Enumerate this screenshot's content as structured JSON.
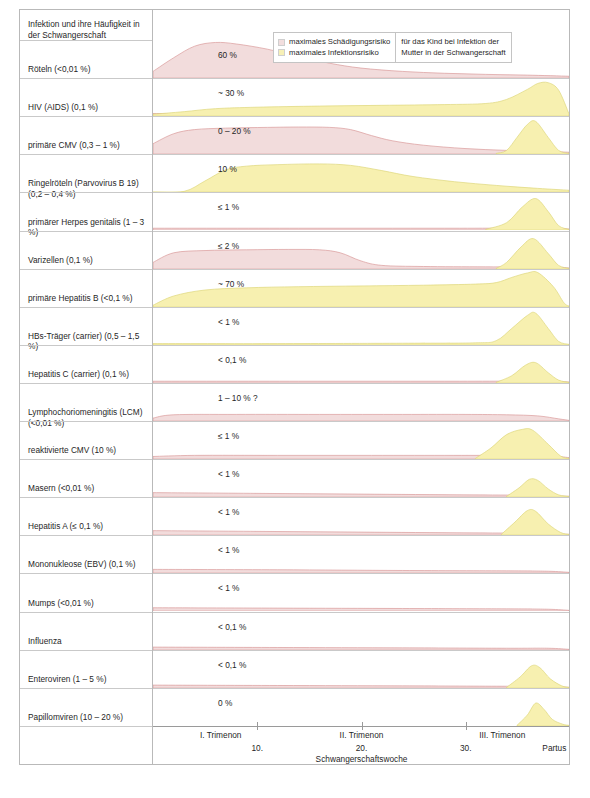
{
  "header": {
    "title": "Infektion und ihre Häufigkeit in der Schwangerschaft"
  },
  "legend": {
    "items": [
      {
        "label": "maximales Schädigungsrisiko",
        "color": "#f2dede"
      },
      {
        "label": "maximales Infektionsrisiko",
        "color": "#f7f0b6"
      }
    ],
    "note_line1": "für das Kind bei Infektion der",
    "note_line2": "Mutter in der Schwangerschaft"
  },
  "axis": {
    "trimester": [
      "I. Trimenon",
      "II. Trimenon",
      "III. Trimenon"
    ],
    "weeks": [
      "10.",
      "20.",
      "30."
    ],
    "partus": "Partus",
    "xlabel": "Schwangerschaftswoche"
  },
  "colors": {
    "damage_fill": "#f2dcdc",
    "damage_stroke": "#d99a9a",
    "infection_fill": "#f7f0b0",
    "infection_stroke": "#ded77a",
    "separator": "#c9c9c9",
    "border": "#b9b9b9"
  },
  "chart_data": {
    "type": "area",
    "title": "Infektion und ihre Häufigkeit in der Schwangerschaft",
    "xlabel": "Schwangerschaftswoche",
    "ylabel": "Risiko",
    "x_ticks": [
      10,
      20,
      30
    ],
    "x_tick_labels": [
      "10.",
      "20.",
      "30."
    ],
    "x_range": [
      0,
      40
    ],
    "grid": false,
    "legend_position": "top-right",
    "series_names": [
      "maximales Schädigungsrisiko",
      "maximales Infektionsrisiko"
    ],
    "rows": [
      {
        "infection": "Röteln (<0,01 %)",
        "value": "60 %",
        "damage": [
          [
            0,
            0.18
          ],
          [
            2,
            0.55
          ],
          [
            4,
            0.86
          ],
          [
            6,
            0.96
          ],
          [
            8,
            0.92
          ],
          [
            11,
            0.78
          ],
          [
            14,
            0.58
          ],
          [
            17,
            0.4
          ],
          [
            20,
            0.27
          ],
          [
            24,
            0.18
          ],
          [
            28,
            0.13
          ],
          [
            32,
            0.1
          ],
          [
            36,
            0.08
          ],
          [
            40,
            0.05
          ]
        ],
        "infection_curve": []
      },
      {
        "infection": "HIV (AIDS) (0,1 %)",
        "value": "~ 30 %",
        "damage": [
          [
            0,
            0.07
          ],
          [
            10,
            0.06
          ],
          [
            20,
            0.05
          ],
          [
            30,
            0.05
          ],
          [
            36,
            0.05
          ],
          [
            39,
            0.05
          ],
          [
            40,
            0.02
          ]
        ],
        "infection_curve": [
          [
            0,
            0.05
          ],
          [
            3,
            0.12
          ],
          [
            6,
            0.2
          ],
          [
            10,
            0.24
          ],
          [
            16,
            0.27
          ],
          [
            22,
            0.29
          ],
          [
            28,
            0.31
          ],
          [
            32,
            0.34
          ],
          [
            34,
            0.45
          ],
          [
            36,
            0.72
          ],
          [
            37,
            0.88
          ],
          [
            38,
            0.9
          ],
          [
            39,
            0.7
          ],
          [
            40,
            0.06
          ]
        ]
      },
      {
        "infection": "primäre CMV (0,3 – 1 %)",
        "value": "0 – 20 %",
        "damage": [
          [
            0,
            0.28
          ],
          [
            2,
            0.55
          ],
          [
            4,
            0.66
          ],
          [
            7,
            0.7
          ],
          [
            11,
            0.72
          ],
          [
            14,
            0.73
          ],
          [
            17,
            0.72
          ],
          [
            19,
            0.66
          ],
          [
            21,
            0.5
          ],
          [
            23,
            0.36
          ],
          [
            26,
            0.24
          ],
          [
            30,
            0.15
          ],
          [
            34,
            0.1
          ],
          [
            38,
            0.07
          ],
          [
            40,
            0.05
          ]
        ],
        "infection_curve": [
          [
            33,
            0.02
          ],
          [
            34,
            0.1
          ],
          [
            35,
            0.45
          ],
          [
            36,
            0.8
          ],
          [
            36.8,
            0.88
          ],
          [
            38,
            0.45
          ],
          [
            39,
            0.1
          ],
          [
            40,
            0.02
          ]
        ]
      },
      {
        "infection": "Ringelröteln (Parvovirus B 19) (0,2 – 0,4 %)",
        "value": "10 %",
        "damage": [],
        "infection_curve": [
          [
            0,
            0.0
          ],
          [
            3,
            0.02
          ],
          [
            5,
            0.3
          ],
          [
            7,
            0.6
          ],
          [
            9,
            0.7
          ],
          [
            12,
            0.74
          ],
          [
            16,
            0.76
          ],
          [
            19,
            0.72
          ],
          [
            22,
            0.58
          ],
          [
            25,
            0.42
          ],
          [
            29,
            0.28
          ],
          [
            33,
            0.18
          ],
          [
            37,
            0.1
          ],
          [
            40,
            0.05
          ]
        ]
      },
      {
        "infection": "primärer Herpes genitalis (1 – 3 %)",
        "value": "≤ 1 %",
        "damage": [
          [
            0,
            0.05
          ],
          [
            14,
            0.05
          ],
          [
            28,
            0.05
          ],
          [
            38,
            0.05
          ],
          [
            40,
            0.03
          ]
        ],
        "infection_curve": [
          [
            32,
            0.02
          ],
          [
            34,
            0.2
          ],
          [
            35.5,
            0.62
          ],
          [
            36.8,
            0.85
          ],
          [
            38,
            0.5
          ],
          [
            39,
            0.12
          ],
          [
            40,
            0.02
          ]
        ]
      },
      {
        "infection": "Varizellen (0,1 %)",
        "value": "≤ 2 %",
        "damage": [
          [
            0,
            0.18
          ],
          [
            2,
            0.44
          ],
          [
            5,
            0.5
          ],
          [
            9,
            0.52
          ],
          [
            13,
            0.53
          ],
          [
            16,
            0.52
          ],
          [
            18,
            0.44
          ],
          [
            20,
            0.22
          ],
          [
            22,
            0.1
          ],
          [
            26,
            0.07
          ],
          [
            32,
            0.06
          ],
          [
            38,
            0.06
          ],
          [
            40,
            0.03
          ]
        ],
        "infection_curve": [
          [
            33,
            0.02
          ],
          [
            34,
            0.18
          ],
          [
            35.4,
            0.6
          ],
          [
            36.6,
            0.82
          ],
          [
            38,
            0.42
          ],
          [
            39,
            0.1
          ],
          [
            40,
            0.02
          ]
        ]
      },
      {
        "infection": "primäre Hepatitis B (<0,1 %)",
        "value": "~ 70 %",
        "damage": [],
        "infection_curve": [
          [
            0,
            0.05
          ],
          [
            2,
            0.3
          ],
          [
            5,
            0.46
          ],
          [
            9,
            0.52
          ],
          [
            14,
            0.55
          ],
          [
            20,
            0.57
          ],
          [
            26,
            0.59
          ],
          [
            31,
            0.62
          ],
          [
            33,
            0.66
          ],
          [
            34.5,
            0.8
          ],
          [
            36,
            0.92
          ],
          [
            37,
            0.93
          ],
          [
            38.5,
            0.55
          ],
          [
            39.5,
            0.12
          ],
          [
            40,
            0.03
          ]
        ]
      },
      {
        "infection": "HBs-Träger (carrier) (0,5 – 1,5 %)",
        "value": "< 1 %",
        "damage": [],
        "infection_curve": [
          [
            0,
            0.04
          ],
          [
            12,
            0.04
          ],
          [
            24,
            0.05
          ],
          [
            31,
            0.06
          ],
          [
            33,
            0.12
          ],
          [
            34.5,
            0.45
          ],
          [
            36,
            0.8
          ],
          [
            36.8,
            0.86
          ],
          [
            38,
            0.45
          ],
          [
            39,
            0.1
          ],
          [
            40,
            0.02
          ]
        ]
      },
      {
        "infection": "Hepatitis C (carrier) (0,1 %)",
        "value": "< 0,1 %",
        "damage": [
          [
            0,
            0.05
          ],
          [
            14,
            0.05
          ],
          [
            28,
            0.05
          ],
          [
            38,
            0.05
          ],
          [
            40,
            0.03
          ]
        ],
        "infection_curve": [
          [
            33,
            0.02
          ],
          [
            34.5,
            0.2
          ],
          [
            35.8,
            0.48
          ],
          [
            36.8,
            0.55
          ],
          [
            38,
            0.28
          ],
          [
            39,
            0.08
          ],
          [
            40,
            0.02
          ]
        ]
      },
      {
        "infection": "Lymphochoriomeningitis (LCM) (<0,01 %)",
        "value": "1 – 10 % ?",
        "damage": [
          [
            0,
            0.08
          ],
          [
            2,
            0.17
          ],
          [
            8,
            0.18
          ],
          [
            16,
            0.18
          ],
          [
            24,
            0.18
          ],
          [
            30,
            0.18
          ],
          [
            34,
            0.17
          ],
          [
            37,
            0.14
          ],
          [
            39,
            0.06
          ],
          [
            40,
            0.02
          ]
        ],
        "infection_curve": []
      },
      {
        "infection": "reaktivierte CMV (10 %)",
        "value": "≤ 1 %",
        "damage": [
          [
            0,
            0.07
          ],
          [
            4,
            0.1
          ],
          [
            12,
            0.1
          ],
          [
            20,
            0.1
          ],
          [
            28,
            0.1
          ],
          [
            34,
            0.1
          ],
          [
            38,
            0.09
          ],
          [
            40,
            0.04
          ]
        ],
        "infection_curve": [
          [
            31,
            0.02
          ],
          [
            32.5,
            0.3
          ],
          [
            34,
            0.66
          ],
          [
            35.5,
            0.8
          ],
          [
            36.5,
            0.78
          ],
          [
            38,
            0.4
          ],
          [
            39.2,
            0.08
          ],
          [
            40,
            0.02
          ]
        ]
      },
      {
        "infection": "Masern (<0,01 %)",
        "value": "< 1 %",
        "damage": [
          [
            0,
            0.12
          ],
          [
            10,
            0.1
          ],
          [
            20,
            0.08
          ],
          [
            30,
            0.06
          ],
          [
            36,
            0.05
          ],
          [
            40,
            0.02
          ]
        ],
        "infection_curve": [
          [
            34,
            0.02
          ],
          [
            35.2,
            0.25
          ],
          [
            36.2,
            0.48
          ],
          [
            37,
            0.45
          ],
          [
            38,
            0.22
          ],
          [
            39,
            0.06
          ],
          [
            40,
            0.02
          ]
        ]
      },
      {
        "infection": "Hepatitis A (≤ 0,1 %)",
        "value": "< 1 %",
        "damage": [
          [
            0,
            0.12
          ],
          [
            10,
            0.1
          ],
          [
            20,
            0.08
          ],
          [
            30,
            0.06
          ],
          [
            36,
            0.05
          ],
          [
            40,
            0.02
          ]
        ],
        "infection_curve": [
          [
            33.5,
            0.02
          ],
          [
            34.8,
            0.35
          ],
          [
            36,
            0.66
          ],
          [
            36.8,
            0.64
          ],
          [
            38,
            0.3
          ],
          [
            39.2,
            0.07
          ],
          [
            40,
            0.02
          ]
        ]
      },
      {
        "infection": "Mononukleose (EBV) (0,1 %)",
        "value": "< 1 %",
        "damage": [
          [
            0,
            0.1
          ],
          [
            12,
            0.09
          ],
          [
            24,
            0.07
          ],
          [
            34,
            0.06
          ],
          [
            38,
            0.05
          ],
          [
            40,
            0.02
          ]
        ],
        "infection_curve": []
      },
      {
        "infection": "Mumps (<0,01 %)",
        "value": "< 1 %",
        "damage": [
          [
            0,
            0.09
          ],
          [
            12,
            0.08
          ],
          [
            24,
            0.07
          ],
          [
            34,
            0.06
          ],
          [
            38,
            0.05
          ],
          [
            40,
            0.02
          ]
        ],
        "infection_curve": []
      },
      {
        "infection": "Influenza",
        "value": "< 0,1 %",
        "damage": [
          [
            0,
            0.08
          ],
          [
            12,
            0.07
          ],
          [
            24,
            0.06
          ],
          [
            34,
            0.05
          ],
          [
            38,
            0.05
          ],
          [
            40,
            0.02
          ]
        ],
        "infection_curve": []
      },
      {
        "infection": "Enteroviren (1 – 5 %)",
        "value": "< 0,1 %",
        "damage": [
          [
            0,
            0.08
          ],
          [
            12,
            0.07
          ],
          [
            24,
            0.06
          ],
          [
            34,
            0.05
          ],
          [
            38,
            0.05
          ],
          [
            40,
            0.02
          ]
        ],
        "infection_curve": [
          [
            34,
            0.02
          ],
          [
            35.3,
            0.3
          ],
          [
            36.4,
            0.6
          ],
          [
            37.2,
            0.55
          ],
          [
            38.2,
            0.25
          ],
          [
            39.3,
            0.06
          ],
          [
            40,
            0.02
          ]
        ]
      },
      {
        "infection": "Papillomviren (10 – 20 %)",
        "value": "0 %",
        "damage": [],
        "infection_curve": [
          [
            35,
            0.02
          ],
          [
            36,
            0.3
          ],
          [
            36.8,
            0.62
          ],
          [
            37.6,
            0.45
          ],
          [
            38.4,
            0.18
          ],
          [
            39.4,
            0.05
          ],
          [
            40,
            0.02
          ]
        ]
      }
    ]
  }
}
